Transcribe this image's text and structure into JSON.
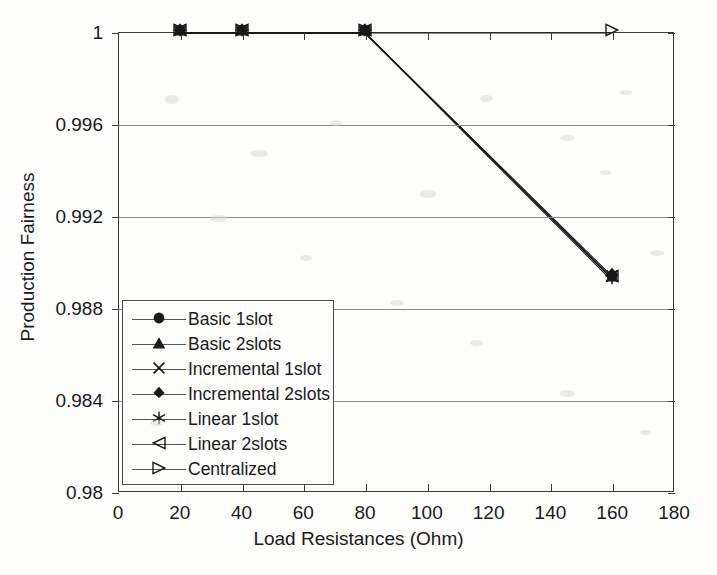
{
  "chart_data": {
    "type": "line",
    "title": "",
    "xlabel": "Load Resistances (Ohm)",
    "ylabel": "Production Fairness",
    "xlim": [
      0,
      180
    ],
    "ylim": [
      0.98,
      1
    ],
    "xticks": [
      0,
      20,
      40,
      60,
      80,
      100,
      120,
      140,
      160,
      180
    ],
    "xtick_labels": [
      "0",
      "20",
      "40",
      "60",
      "80",
      "100",
      "120",
      "140",
      "160",
      "180"
    ],
    "yticks": [
      0.98,
      0.984,
      0.988,
      0.992,
      0.996,
      1
    ],
    "ytick_labels": [
      "0.98",
      "0.984",
      "0.988",
      "0.992",
      "0.996",
      "1"
    ],
    "grid": "horizontal",
    "legend_position": "lower left inside axes",
    "x": [
      20,
      40,
      80,
      160
    ],
    "series": [
      {
        "name": "Basic 1slot",
        "marker": "circle-filled",
        "values": [
          1,
          1,
          1,
          0.9893
        ]
      },
      {
        "name": "Basic 2slots",
        "marker": "triangle-up-filled",
        "values": [
          1,
          1,
          1,
          0.9893
        ]
      },
      {
        "name": "Incremental 1slot",
        "marker": "cross-x",
        "values": [
          1,
          1,
          1,
          0.9893
        ]
      },
      {
        "name": "Incremental 2slots",
        "marker": "diamond-filled",
        "values": [
          1,
          1,
          1,
          0.9894
        ]
      },
      {
        "name": "Linear 1slot",
        "marker": "asterisk",
        "values": [
          1,
          1,
          1,
          0.9892
        ]
      },
      {
        "name": "Linear 2slots",
        "marker": "triangle-left-open",
        "values": [
          1,
          1,
          1,
          0.9893
        ]
      },
      {
        "name": "Centralized",
        "marker": "triangle-right-open",
        "values": [
          1,
          1,
          1,
          1
        ]
      }
    ]
  },
  "legend": {
    "entries": [
      {
        "label": "Basic 1slot",
        "marker": "circle-filled"
      },
      {
        "label": "Basic 2slots",
        "marker": "triangle-up-filled"
      },
      {
        "label": "Incremental 1slot",
        "marker": "cross-x"
      },
      {
        "label": "Incremental 2slots",
        "marker": "diamond-filled"
      },
      {
        "label": "Linear 1slot",
        "marker": "asterisk"
      },
      {
        "label": "Linear 2slots",
        "marker": "triangle-left-open"
      },
      {
        "label": "Centralized",
        "marker": "triangle-right-open"
      }
    ]
  },
  "colors": {
    "axis": "#3a3a3a",
    "grid": "#8a8a8a",
    "data": "#1a1a1a",
    "background": "#fdfdfc"
  }
}
